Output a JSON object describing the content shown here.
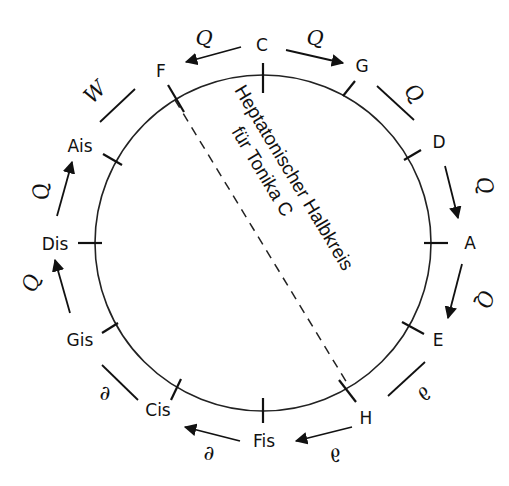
{
  "diagram": {
    "type": "circle-of-fifths",
    "center": [
      263,
      243
    ],
    "radius": 168,
    "stroke_color": "#222222",
    "title_line1": "Heptatonischer Halbkreis",
    "title_line2": "für Tonika C",
    "notes": [
      {
        "label": "C",
        "angle": 0
      },
      {
        "label": "G",
        "angle": 30
      },
      {
        "label": "D",
        "angle": 60
      },
      {
        "label": "A",
        "angle": 90
      },
      {
        "label": "E",
        "angle": 120
      },
      {
        "label": "H",
        "angle": 150
      },
      {
        "label": "Fis",
        "angle": 180
      },
      {
        "label": "Cis",
        "angle": 210
      },
      {
        "label": "Gis",
        "angle": 240
      },
      {
        "label": "Dis",
        "angle": 270
      },
      {
        "label": "Ais",
        "angle": 300
      },
      {
        "label": "F",
        "angle": 330
      }
    ],
    "intervals": [
      {
        "from": "C",
        "to": "F",
        "symbol": "Q",
        "arrow": true
      },
      {
        "from": "C",
        "to": "G",
        "symbol": "Q",
        "arrow": true
      },
      {
        "from": "G",
        "to": "D",
        "symbol": "Q",
        "arrow": false
      },
      {
        "from": "D",
        "to": "A",
        "symbol": "Q",
        "arrow": true
      },
      {
        "from": "A",
        "to": "E",
        "symbol": "Q",
        "arrow": true
      },
      {
        "from": "E",
        "to": "H",
        "symbol": "∂",
        "arrow": false
      },
      {
        "from": "H",
        "to": "Fis",
        "symbol": "∂",
        "arrow": true
      },
      {
        "from": "Fis",
        "to": "Cis",
        "symbol": "∂",
        "arrow": true
      },
      {
        "from": "Cis",
        "to": "Gis",
        "symbol": "∂",
        "arrow": false
      },
      {
        "from": "Gis",
        "to": "Dis",
        "symbol": "Q",
        "arrow": true
      },
      {
        "from": "Dis",
        "to": "Ais",
        "symbol": "Q",
        "arrow": true
      },
      {
        "from": "Ais",
        "to": "F",
        "symbol": "W",
        "arrow": false
      }
    ],
    "divider": {
      "from": "F",
      "to": "H",
      "style": "dashed"
    }
  }
}
